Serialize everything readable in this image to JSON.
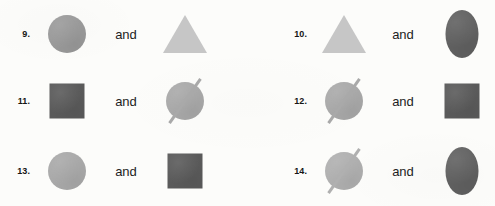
{
  "page": {
    "background_color": "#fcfcfa",
    "conjunction_label": "and",
    "text_color": "#1d1d1d",
    "number_color": "#151515"
  },
  "palette": {
    "light_gray": "#c6c6c6",
    "medium_gray": "#9a9a9a",
    "medium_light_gray": "#a9a9a9",
    "dark_gray": "#5a5a5a",
    "dark_oval_gray": "#616161"
  },
  "items": [
    {
      "number": "9.",
      "conjunction": "and",
      "left_shape": {
        "shape": "circle",
        "color": "#9a9a9a",
        "name": "gray-circle"
      },
      "right_shape": {
        "shape": "triangle",
        "color": "#c6c6c6",
        "name": "light-gray-triangle"
      }
    },
    {
      "number": "10.",
      "conjunction": "and",
      "left_shape": {
        "shape": "triangle",
        "color": "#c6c6c6",
        "name": "light-gray-triangle"
      },
      "right_shape": {
        "shape": "oval",
        "color": "#616161",
        "name": "dark-gray-oval"
      }
    },
    {
      "number": "11.",
      "conjunction": "and",
      "left_shape": {
        "shape": "square",
        "color": "#5a5a5a",
        "name": "dark-gray-square"
      },
      "right_shape": {
        "shape": "circle-line",
        "color": "#a9a9a9",
        "name": "gray-circle-with-line"
      }
    },
    {
      "number": "12.",
      "conjunction": "and",
      "left_shape": {
        "shape": "circle-line",
        "color": "#a9a9a9",
        "name": "gray-circle-with-line"
      },
      "right_shape": {
        "shape": "square",
        "color": "#5a5a5a",
        "name": "dark-gray-square"
      }
    },
    {
      "number": "13.",
      "conjunction": "and",
      "left_shape": {
        "shape": "circle",
        "color": "#a9a9a9",
        "name": "gray-circle"
      },
      "right_shape": {
        "shape": "square",
        "color": "#5a5a5a",
        "name": "dark-gray-square"
      }
    },
    {
      "number": "14.",
      "conjunction": "and",
      "left_shape": {
        "shape": "circle-line",
        "color": "#b0b0b0",
        "name": "gray-circle-with-line"
      },
      "right_shape": {
        "shape": "oval",
        "color": "#616161",
        "name": "dark-gray-oval"
      }
    }
  ],
  "layout": {
    "columns": 2,
    "rows": 3,
    "column_x": [
      0,
      248
    ],
    "row_y": [
      3,
      66,
      134
    ]
  }
}
